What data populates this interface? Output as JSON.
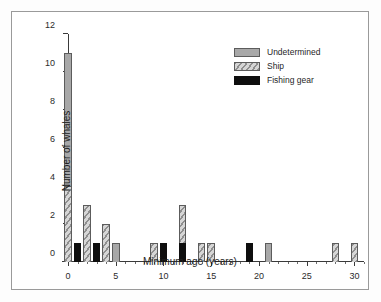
{
  "chart_data": {
    "type": "bar",
    "title": "",
    "subtitle": "",
    "xlabel": "Minimum age (years)",
    "ylabel": "Number of whales",
    "xlim": [
      0,
      31
    ],
    "ylim": [
      0,
      12
    ],
    "x_ticks": [
      0,
      5,
      10,
      15,
      20,
      25,
      30
    ],
    "x_tick_labels": [
      "0",
      "5",
      "10",
      "15",
      "20",
      "25",
      "30"
    ],
    "x_minor_tick_step": 1,
    "y_ticks": [
      0,
      2,
      4,
      6,
      8,
      10,
      12
    ],
    "y_tick_labels": [
      "0",
      "2",
      "4",
      "6",
      "8",
      "10",
      "12"
    ],
    "grid": false,
    "stacked": true,
    "bar_width_years": 0.8,
    "legend_position": "top-right",
    "categories": [
      0,
      1,
      2,
      3,
      4,
      5,
      9,
      10,
      12,
      14,
      15,
      19,
      21,
      28,
      30
    ],
    "series": [
      {
        "name": "Fishing gear",
        "color": "#0e0e0e",
        "fill": "solid-black",
        "values": [
          0,
          1,
          0,
          1,
          0,
          0,
          0,
          1,
          1,
          0,
          0,
          1,
          0,
          0,
          0
        ]
      },
      {
        "name": "Ship",
        "color": "#9a9a9a",
        "fill": "diagonal-hatch",
        "values": [
          4,
          0,
          3,
          0,
          2,
          0,
          1,
          0,
          2,
          1,
          1,
          0,
          0,
          1,
          1
        ]
      },
      {
        "name": "Undetermined",
        "color": "#a8a8a8",
        "fill": "solid-gray",
        "values": [
          7,
          0,
          0,
          0,
          0,
          1,
          0,
          0,
          0,
          0,
          0,
          0,
          1,
          0,
          0
        ]
      }
    ],
    "totals": [
      11,
      1,
      3,
      1,
      2,
      1,
      1,
      1,
      3,
      1,
      1,
      1,
      1,
      1,
      1
    ]
  },
  "legend": {
    "items": [
      {
        "label": "Undetermined",
        "key": "undetermined"
      },
      {
        "label": "Ship",
        "key": "ship"
      },
      {
        "label": "Fishing gear",
        "key": "fishing"
      }
    ]
  }
}
